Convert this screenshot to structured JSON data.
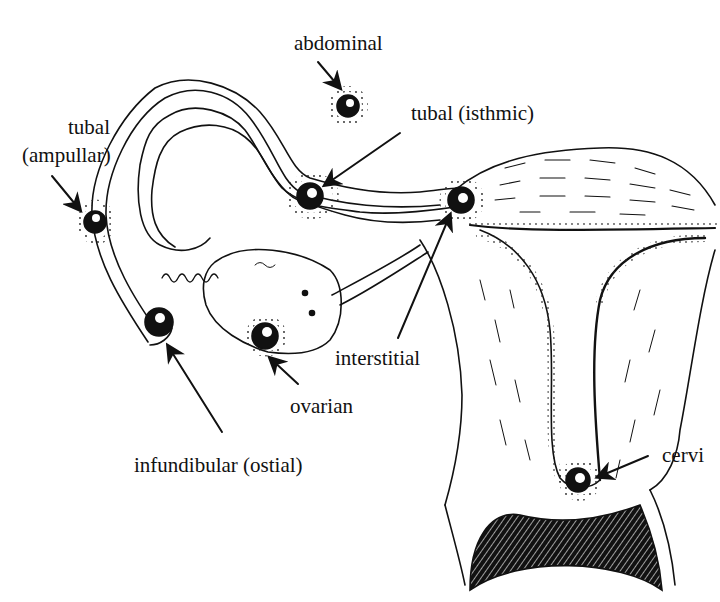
{
  "diagram": {
    "labels": {
      "abdominal": "abdominal",
      "tubal_isthmic": "tubal (isthmic)",
      "tubal_ampullar_line1": "tubal",
      "tubal_ampullar_line2": "(ampullar)",
      "interstitial": "interstitial",
      "ovarian": "ovarian",
      "infundibular": "infundibular (ostial)",
      "cervical": "cervi"
    },
    "colors": {
      "ink": "#111111",
      "background": "#ffffff"
    }
  }
}
